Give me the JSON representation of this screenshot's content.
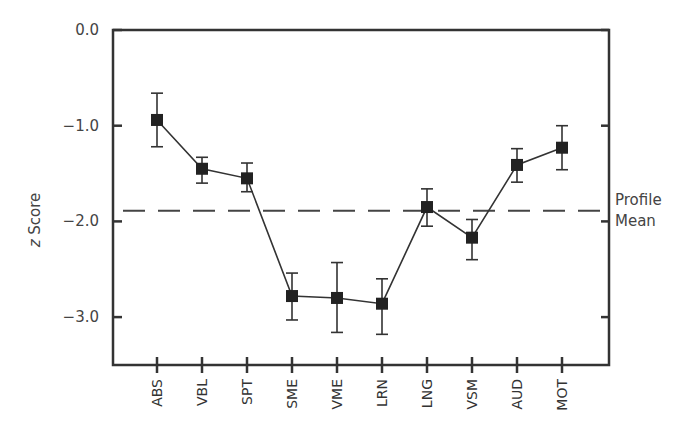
{
  "chart_data": {
    "type": "line",
    "title": "",
    "xlabel": "",
    "ylabel": "z Score",
    "ylabel_italic_prefix": "z",
    "ylabel_rest": " Score",
    "ylim": [
      -3.5,
      0.0
    ],
    "yticks": [
      0.0,
      -1.0,
      -2.0,
      -3.0
    ],
    "ytick_labels": [
      "0.0",
      "−1.0",
      "−2.0",
      "−3.0"
    ],
    "grid": false,
    "categories": [
      "ABS",
      "VBL",
      "SPT",
      "SME",
      "VME",
      "LRN",
      "LNG",
      "VSM",
      "AUD",
      "MOT"
    ],
    "series": [
      {
        "name": "z Score",
        "marker": "square",
        "values": [
          -0.94,
          -1.45,
          -1.55,
          -2.78,
          -2.8,
          -2.86,
          -1.85,
          -2.17,
          -1.41,
          -1.23
        ],
        "err_low": [
          -1.22,
          -1.6,
          -1.69,
          -3.03,
          -3.16,
          -3.18,
          -2.05,
          -2.4,
          -1.59,
          -1.46
        ],
        "err_high": [
          -0.66,
          -1.33,
          -1.39,
          -2.54,
          -2.43,
          -2.6,
          -1.66,
          -1.98,
          -1.24,
          -1.0
        ]
      }
    ],
    "reference_line": {
      "label": "Profile Mean",
      "label_line1": "Profile",
      "label_line2": "Mean",
      "value": -1.89,
      "style": "dashed"
    },
    "legend": null
  }
}
